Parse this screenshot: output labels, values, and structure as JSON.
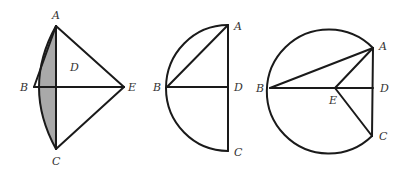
{
  "figures": [
    {
      "id": "figure-1",
      "labels": {
        "A": "A",
        "B": "B",
        "C": "C",
        "D": "D",
        "E": "E"
      },
      "shading_color": "#a9a9a9"
    },
    {
      "id": "figure-2",
      "labels": {
        "A": "A",
        "B": "B",
        "C": "C",
        "D": "D"
      }
    },
    {
      "id": "figure-3",
      "labels": {
        "A": "A",
        "B": "B",
        "C": "C",
        "D": "D",
        "E": "E"
      }
    }
  ],
  "colors": {
    "line": "#1a1a1a",
    "label": "#333333",
    "background": "#ffffff"
  }
}
